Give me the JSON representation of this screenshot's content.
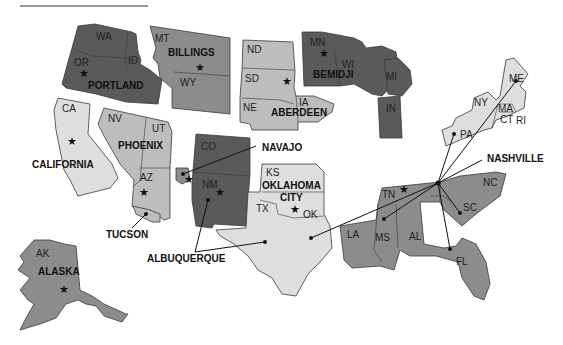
{
  "map": {
    "type": "US regional map (Indian Health Service areas)",
    "colors": {
      "dark": "#5a5a5a",
      "medium": "#8c8c8c",
      "light": "#bdbdbd",
      "very_light": "#dedede"
    },
    "areas": [
      {
        "name": "PORTLAND",
        "states": [
          "WA",
          "OR",
          "ID"
        ],
        "shade": "dark"
      },
      {
        "name": "BILLINGS",
        "states": [
          "MT",
          "WY"
        ],
        "shade": "medium"
      },
      {
        "name": "ABERDEEN",
        "states": [
          "ND",
          "SD",
          "NE",
          "IA"
        ],
        "shade": "light"
      },
      {
        "name": "BEMIDJI",
        "states": [
          "MN",
          "WI",
          "MI",
          "IN"
        ],
        "shade": "dark"
      },
      {
        "name": "CALIFORNIA",
        "states": [
          "CA"
        ],
        "shade": "very_light"
      },
      {
        "name": "PHOENIX",
        "states": [
          "NV",
          "UT",
          "AZ"
        ],
        "shade": "light"
      },
      {
        "name": "NAVAJO",
        "states": [],
        "shade": "medium"
      },
      {
        "name": "ALBUQUERQUE",
        "states": [
          "CO",
          "NM"
        ],
        "shade": "dark"
      },
      {
        "name": "TUCSON",
        "states": [],
        "shade": "light"
      },
      {
        "name": "OKLAHOMA CITY",
        "states": [
          "KS",
          "OK",
          "TX"
        ],
        "shade": "very_light"
      },
      {
        "name": "NASHVILLE",
        "states": [
          "ME",
          "NY",
          "MA",
          "CT",
          "RI",
          "PA",
          "TN",
          "NC",
          "SC",
          "LA",
          "MS",
          "AL",
          "FL"
        ],
        "shade": "medium"
      },
      {
        "name": "ALASKA",
        "states": [
          "AK"
        ],
        "shade": "medium"
      }
    ],
    "labels": {
      "portland": "PORTLAND",
      "billings": "BILLINGS",
      "bemidji": "BEMIDJI",
      "aberdeen": "ABERDEEN",
      "california": "CALIFORNIA",
      "phoenix": "PHOENIX",
      "navajo": "NAVAJO",
      "tucson": "TUCSON",
      "albuquerque": "ALBUQUERQUE",
      "oklahoma_city_1": "OKLAHOMA",
      "oklahoma_city_2": "CITY",
      "nashville": "NASHVILLE",
      "alaska": "ALASKA"
    },
    "state_abbr": {
      "WA": "WA",
      "OR": "OR",
      "ID": "ID",
      "MT": "MT",
      "WY": "WY",
      "ND": "ND",
      "SD": "SD",
      "NE": "NE",
      "IA": "IA",
      "MN": "MN",
      "WI": "WI",
      "MI": "MI",
      "IN": "IN",
      "CA": "CA",
      "NV": "NV",
      "UT": "UT",
      "AZ": "AZ",
      "CO": "CO",
      "NM": "NM",
      "KS": "KS",
      "OK": "OK",
      "TX": "TX",
      "ME": "ME",
      "NY": "NY",
      "MA": "MA",
      "CT": "CT",
      "RI": "RI",
      "PA": "PA",
      "TN": "TN",
      "NC": "NC",
      "SC": "SC",
      "LA": "LA",
      "MS": "MS",
      "AL": "AL",
      "FL": "FL",
      "AK": "AK"
    },
    "star_symbol": "★",
    "legend_note": "★ = Area office headquarters; ● = location of facility"
  }
}
